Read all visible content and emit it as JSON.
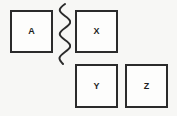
{
  "diagram": {
    "type": "labelled-squares-with-break-line",
    "background_color": "#f7f7f5",
    "stroke_color": "#2b2b2b",
    "box_fill_color": "#fdfdfc",
    "boxes": [
      {
        "id": "a",
        "label": "A",
        "x": 10,
        "y": 10,
        "width": 43,
        "height": 43
      },
      {
        "id": "x",
        "label": "X",
        "x": 75,
        "y": 10,
        "width": 43,
        "height": 43
      },
      {
        "id": "y",
        "label": "Y",
        "x": 75,
        "y": 64,
        "width": 43,
        "height": 44
      },
      {
        "id": "z",
        "label": "Z",
        "x": 125,
        "y": 64,
        "width": 43,
        "height": 44
      }
    ],
    "separator": {
      "name": "wavy-break-line",
      "orientation": "vertical",
      "x": 55,
      "y": 2,
      "width": 16,
      "height": 64,
      "wave_count": 4
    }
  }
}
